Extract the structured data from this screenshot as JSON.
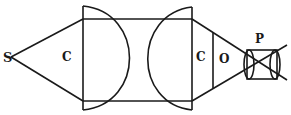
{
  "diagram": {
    "stroke_color": "#1a1a1a",
    "labels": {
      "source": "S",
      "cone_left": "C",
      "cone_right": "C",
      "objective": "O",
      "eyepiece": "P"
    }
  }
}
